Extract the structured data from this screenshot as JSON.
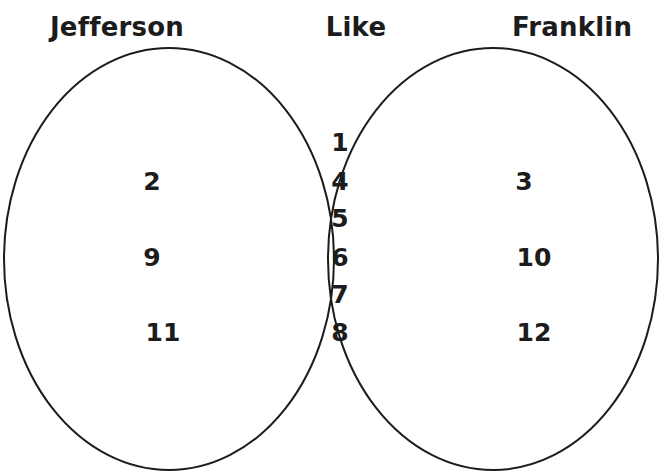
{
  "headings": {
    "left": "Jefferson",
    "middle": "Like",
    "right": "Franklin"
  },
  "regions": {
    "left_only": [
      "2",
      "9",
      "11"
    ],
    "both": [
      "1",
      "4",
      "5",
      "6",
      "7",
      "8"
    ],
    "right_only": [
      "3",
      "10",
      "12"
    ]
  },
  "colors": {
    "stroke": "#1c1c1c",
    "background": "#ffffff"
  }
}
